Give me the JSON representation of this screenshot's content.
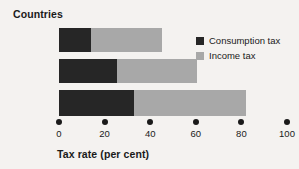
{
  "chart_data": {
    "type": "bar",
    "orientation": "horizontal",
    "stacked": true,
    "title": "Countries",
    "xlabel": "Tax rate (per cent)",
    "ylabel": "",
    "categories": [
      "US",
      "UK",
      "France"
    ],
    "series": [
      {
        "name": "Consumption tax",
        "color": "#262626",
        "values": [
          14,
          25.5,
          33
        ]
      },
      {
        "name": "Income tax",
        "color": "#a8a8a8",
        "values": [
          31,
          35,
          49
        ]
      }
    ],
    "totals": [
      45,
      60.5,
      82
    ],
    "xlim": [
      0,
      100
    ],
    "xticks": [
      0,
      20,
      40,
      60,
      80,
      100
    ],
    "xtick_labels": [
      "0",
      "20",
      "40",
      "60",
      "80",
      "100"
    ],
    "grid": false,
    "legend_position": "top-right",
    "background_color": "#f4f2f0",
    "text_color": "#1a1a1a"
  },
  "legend": {
    "items": [
      {
        "label": "Consumption tax",
        "swatch": "#262626"
      },
      {
        "label": "Income tax",
        "swatch": "#a8a8a8"
      }
    ]
  },
  "artifact": {
    "text": ""
  }
}
